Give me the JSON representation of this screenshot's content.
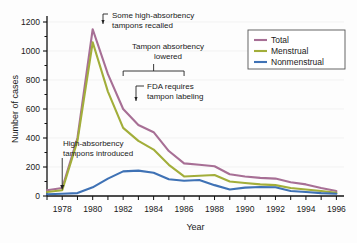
{
  "chart_data": {
    "type": "line",
    "title": "",
    "xlabel": "Year",
    "ylabel": "Number of cases",
    "xlim": [
      1977,
      1996.5
    ],
    "ylim": [
      0,
      1200
    ],
    "yticks": [
      0,
      200,
      400,
      600,
      800,
      1000,
      1200
    ],
    "ytick_labels": [
      "0",
      "200",
      "400",
      "600",
      "800",
      "1000",
      "1200"
    ],
    "xticks": [
      1977,
      1978,
      1979,
      1980,
      1981,
      1982,
      1983,
      1984,
      1985,
      1986,
      1987,
      1988,
      1989,
      1990,
      1991,
      1992,
      1993,
      1994,
      1995,
      1996
    ],
    "xtick_labels": [
      "1978",
      "1980",
      "1982",
      "1984",
      "1986",
      "1988",
      "1990",
      "1992",
      "1994",
      "1996"
    ],
    "xtick_label_years": [
      1978,
      1980,
      1982,
      1984,
      1986,
      1988,
      1990,
      1992,
      1994,
      1996
    ],
    "grid": false,
    "legend_position": "top-right",
    "x": [
      1977,
      1978,
      1979,
      1980,
      1981,
      1982,
      1983,
      1984,
      1985,
      1986,
      1987,
      1988,
      1989,
      1990,
      1991,
      1992,
      1993,
      1994,
      1995,
      1996
    ],
    "series": [
      {
        "name": "Total",
        "color": "#a76f95",
        "values": [
          40,
          55,
          400,
          1150,
          840,
          600,
          490,
          440,
          310,
          225,
          215,
          205,
          150,
          135,
          125,
          120,
          95,
          80,
          55,
          35
        ]
      },
      {
        "name": "Menstrual",
        "color": "#a2ae3a",
        "values": [
          28,
          40,
          380,
          1060,
          720,
          470,
          380,
          320,
          215,
          135,
          140,
          145,
          100,
          90,
          80,
          75,
          55,
          45,
          35,
          22
        ]
      },
      {
        "name": "Nonmenstrual",
        "color": "#3f72b5",
        "values": [
          12,
          15,
          20,
          60,
          120,
          170,
          175,
          160,
          115,
          105,
          110,
          75,
          45,
          58,
          62,
          60,
          35,
          28,
          20,
          15
        ]
      }
    ],
    "annotations": [
      {
        "id": "recalled",
        "text_line1": "Some high-absorbency",
        "text_line2": "tampons recalled",
        "year": 1980,
        "value": 1200
      },
      {
        "id": "absorbency-lowered",
        "text_line1": "Tampon absorbency",
        "text_line2": "lowered",
        "bracket_start_year": 1982,
        "bracket_end_year": 1986
      },
      {
        "id": "fda-labeling",
        "text_line1": "FDA requires",
        "text_line2": "tampon labeling",
        "year": 1982,
        "value": 640
      },
      {
        "id": "introduced",
        "text_line1": "High-absorbency",
        "text_line2": "tampons introduced",
        "year": 1978,
        "value": 40
      }
    ]
  },
  "legend": {
    "items": [
      {
        "label": "Total",
        "color": "#a76f95"
      },
      {
        "label": "Menstrual",
        "color": "#a2ae3a"
      },
      {
        "label": "Nonmenstrual",
        "color": "#3f72b5"
      }
    ]
  }
}
